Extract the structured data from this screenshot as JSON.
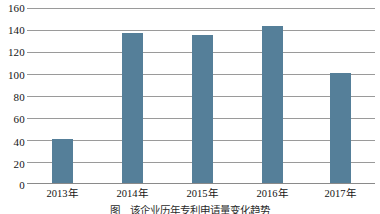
{
  "chart_data": {
    "type": "bar",
    "title": "",
    "subtitle": "",
    "xlabel": "",
    "ylabel": "",
    "categories": [
      "2013年",
      "2014年",
      "2015年",
      "2016年",
      "2017年"
    ],
    "values": [
      40,
      137,
      135,
      144,
      101
    ],
    "ylim": [
      0,
      160
    ],
    "yticks": [
      0,
      20,
      40,
      60,
      80,
      100,
      120,
      140,
      160
    ],
    "ytick_labels": [
      "0",
      "20",
      "40",
      "60",
      "80",
      "100",
      "120",
      "140",
      "160"
    ],
    "grid": true,
    "grid_axis": "y",
    "legend": false,
    "legend_position": "none",
    "series": [
      {
        "name": "",
        "color": "#557f99",
        "values": [
          40,
          137,
          135,
          144,
          101
        ]
      }
    ],
    "annotations": []
  },
  "colors": {
    "bar_fill": "#557f99",
    "gridline": "#9a9a9a",
    "axis_line": "#8a8a8a",
    "text": "#141414",
    "background": "#ffffff"
  },
  "caption": {
    "number": "图",
    "text": "该企业历年专利申请量变化趋势"
  }
}
